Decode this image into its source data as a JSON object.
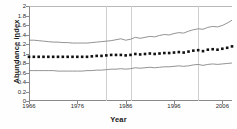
{
  "chart_data": {
    "type": "line",
    "title": "",
    "xlabel": "Year",
    "ylabel": "Abundance index",
    "xlim": [
      1966,
      2008
    ],
    "ylim": [
      0,
      2
    ],
    "xticks": [
      1966,
      1976,
      1986,
      1996,
      2006
    ],
    "xticklabels": [
      "1966",
      "1976",
      "1986",
      "1996",
      "2006"
    ],
    "yticks": [
      0,
      0.2,
      0.4,
      0.6,
      0.8,
      1,
      1.2,
      1.4,
      1.6,
      1.8,
      2
    ],
    "yticklabels": [
      "0",
      "0.2",
      "0.4",
      "0.6",
      "0.8",
      "1",
      "1.2",
      "1.4",
      "1.6",
      "1.8",
      "2"
    ],
    "grid": "vertical",
    "gridlines_x": [
      1982,
      1987,
      2001
    ],
    "legend": "none",
    "colors": {
      "index_marker": "#111111",
      "confidence_band": "#777777",
      "axis": "#8a8a8a",
      "gridline": "#cfcfcf",
      "background": "#ffffff"
    },
    "x": [
      1966,
      1967,
      1968,
      1969,
      1970,
      1971,
      1972,
      1973,
      1974,
      1975,
      1976,
      1977,
      1978,
      1979,
      1980,
      1981,
      1982,
      1983,
      1984,
      1985,
      1986,
      1987,
      1988,
      1989,
      1990,
      1991,
      1992,
      1993,
      1994,
      1995,
      1996,
      1997,
      1998,
      1999,
      2000,
      2001,
      2002,
      2003,
      2004,
      2005,
      2006,
      2007,
      2008
    ],
    "series": [
      {
        "name": "Upper confidence limit",
        "style": "line",
        "values": [
          1.28,
          1.28,
          1.27,
          1.26,
          1.25,
          1.24,
          1.24,
          1.23,
          1.23,
          1.22,
          1.22,
          1.22,
          1.22,
          1.23,
          1.24,
          1.25,
          1.26,
          1.27,
          1.29,
          1.31,
          1.28,
          1.3,
          1.34,
          1.32,
          1.34,
          1.36,
          1.35,
          1.38,
          1.4,
          1.39,
          1.42,
          1.44,
          1.43,
          1.47,
          1.5,
          1.52,
          1.51,
          1.55,
          1.57,
          1.56,
          1.59,
          1.64,
          1.7
        ]
      },
      {
        "name": "Abundance index",
        "style": "markers",
        "values": [
          0.93,
          0.93,
          0.93,
          0.93,
          0.93,
          0.93,
          0.93,
          0.93,
          0.93,
          0.93,
          0.93,
          0.93,
          0.93,
          0.94,
          0.95,
          0.95,
          0.96,
          0.97,
          0.97,
          0.97,
          0.96,
          0.97,
          0.99,
          0.98,
          0.99,
          1.0,
          0.99,
          1.0,
          1.01,
          1.01,
          1.02,
          1.03,
          1.02,
          1.04,
          1.06,
          1.07,
          1.05,
          1.08,
          1.09,
          1.08,
          1.1,
          1.12,
          1.15
        ]
      },
      {
        "name": "Lower confidence limit",
        "style": "line",
        "values": [
          0.64,
          0.64,
          0.64,
          0.64,
          0.64,
          0.64,
          0.63,
          0.63,
          0.63,
          0.63,
          0.63,
          0.63,
          0.64,
          0.64,
          0.65,
          0.65,
          0.66,
          0.67,
          0.67,
          0.68,
          0.67,
          0.68,
          0.7,
          0.69,
          0.7,
          0.71,
          0.7,
          0.71,
          0.72,
          0.72,
          0.73,
          0.74,
          0.73,
          0.74,
          0.76,
          0.77,
          0.75,
          0.77,
          0.78,
          0.77,
          0.78,
          0.79,
          0.8
        ]
      }
    ]
  }
}
